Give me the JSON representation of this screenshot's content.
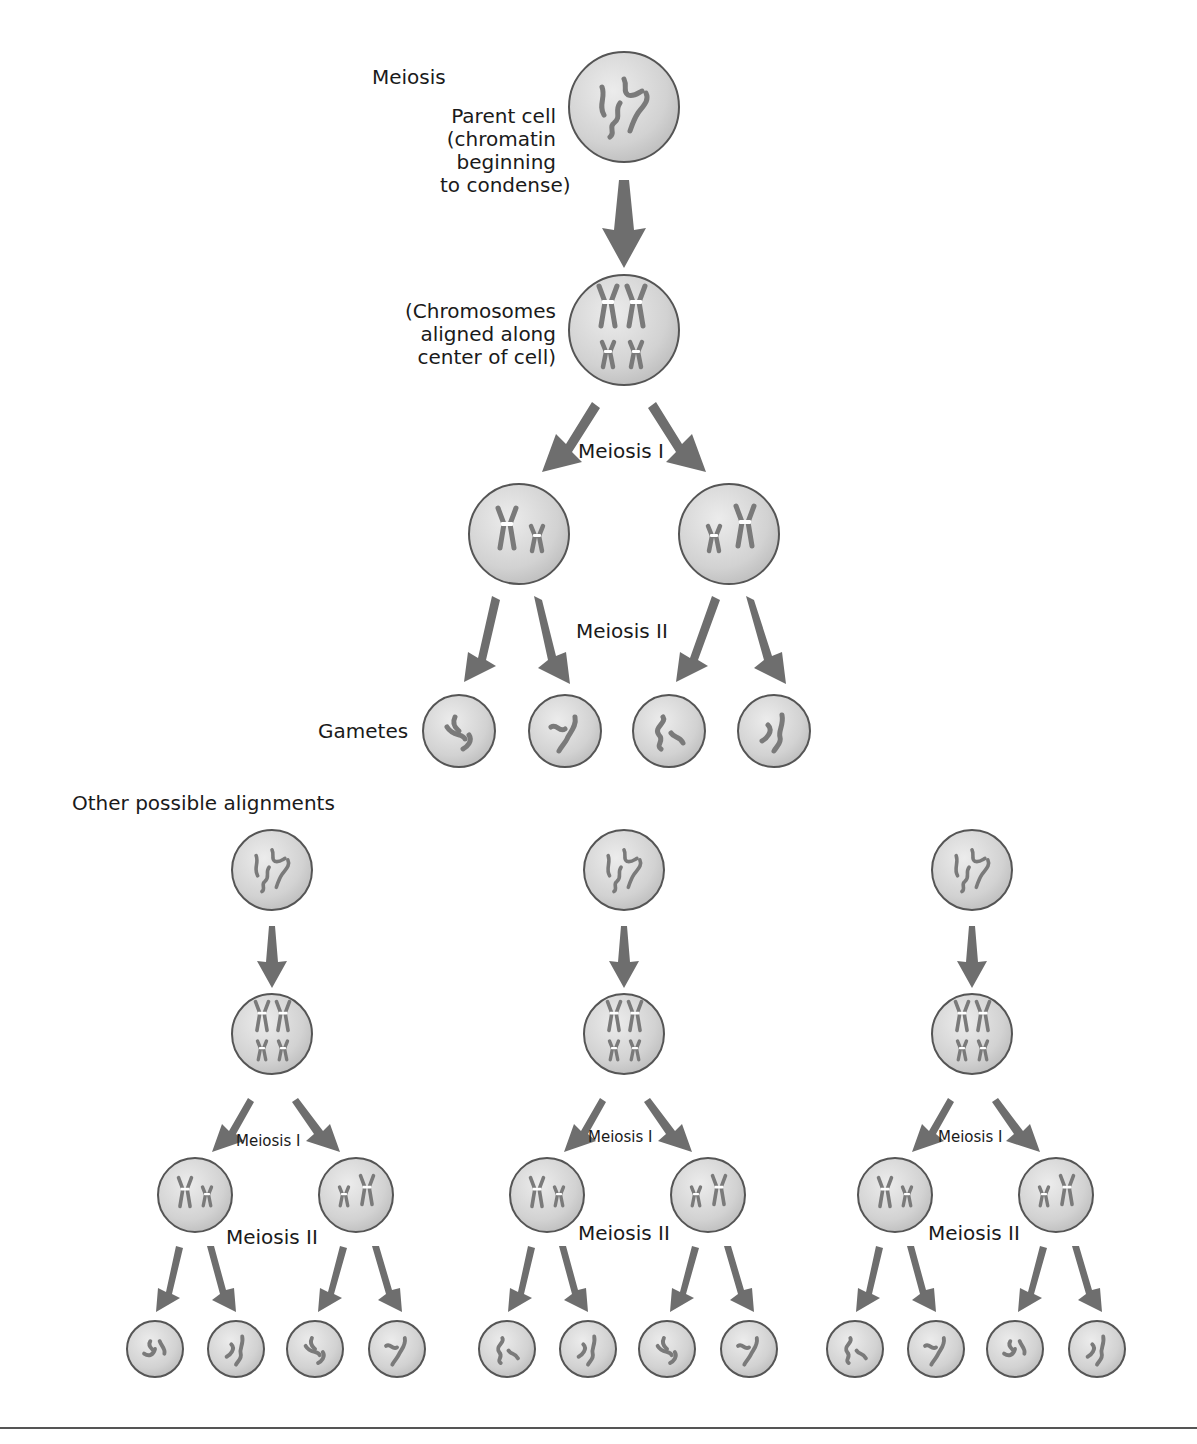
{
  "title": "Meiosis",
  "main": {
    "parent_cell_label": [
      "Parent cell",
      "(chromatin",
      "beginning",
      "to condense)"
    ],
    "aligned_label": [
      "(Chromosomes",
      "aligned along",
      "center of cell)"
    ],
    "meiosis1_label": "Meiosis I",
    "meiosis2_label": "Meiosis II",
    "gametes_label": "Gametes"
  },
  "other_section": {
    "heading": "Other possible alignments",
    "diagrams": [
      {
        "meiosis1_label": "Meiosis I",
        "meiosis2_label": "Meiosis II"
      },
      {
        "meiosis1_label": "Meiosis I",
        "meiosis2_label": "Meiosis II"
      },
      {
        "meiosis1_label": "Meiosis I",
        "meiosis2_label": "Meiosis II"
      }
    ]
  },
  "colors": {
    "cell_fill": "#d4d4d4",
    "cell_stroke": "#555555",
    "chromosome": "#7a7a7a",
    "arrow": "#6e6e6e"
  },
  "icons": {
    "cell": "cell-circle-icon",
    "chromosome": "chromosome-icon",
    "arrow": "down-arrow-icon"
  }
}
